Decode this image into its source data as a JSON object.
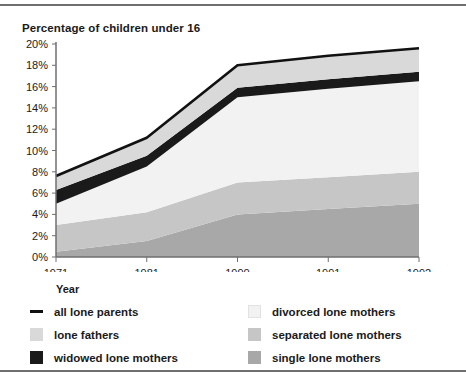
{
  "chart_title": "Percentage of children under 16",
  "axis_name_label": "Year",
  "legend": [
    {
      "key": "all_lone_parents",
      "label": "all lone parents",
      "marker": "line",
      "color": "#111111"
    },
    {
      "key": "divorced_lone_mothers",
      "label": "divorced lone mothers",
      "marker": "box",
      "color": "#f2f2f2"
    },
    {
      "key": "lone_fathers",
      "label": "lone fathers",
      "marker": "box",
      "color": "#d9d9d9"
    },
    {
      "key": "separated_lone_mothers",
      "label": "separated lone mothers",
      "marker": "box",
      "color": "#c6c6c6"
    },
    {
      "key": "widowed_lone_mothers",
      "label": "widowed lone mothers",
      "marker": "box",
      "color": "#1a1a1a"
    },
    {
      "key": "single_lone_mothers",
      "label": "single lone mothers",
      "marker": "box",
      "color": "#a8a8a8"
    }
  ],
  "chart_data": {
    "type": "area",
    "title": "Percentage of children under 16",
    "xlabel": "Year",
    "ylabel": "Percentage of children under 16",
    "categories": [
      "1971",
      "1981",
      "1990",
      "1991",
      "1992"
    ],
    "x_tick_labels": [
      "1971",
      "1981",
      "1990",
      "1991",
      "1992"
    ],
    "y_tick_labels": [
      "0%",
      "2%",
      "4%",
      "6%",
      "8%",
      "10%",
      "12%",
      "14%",
      "16%",
      "18%",
      "20%"
    ],
    "ylim": [
      0,
      20
    ],
    "y_tick_step": 2,
    "grid": false,
    "legend_position": "below-plot",
    "stacked": true,
    "stack_order_bottom_to_top": [
      "single lone mothers",
      "separated lone mothers",
      "divorced lone mothers",
      "widowed lone mothers",
      "lone fathers"
    ],
    "series": [
      {
        "name": "single lone mothers",
        "color": "#a8a8a8",
        "values": [
          0.5,
          1.5,
          4.0,
          4.5,
          5.0
        ]
      },
      {
        "name": "separated lone mothers",
        "color": "#c6c6c6",
        "values": [
          2.5,
          2.7,
          3.0,
          3.0,
          3.0
        ]
      },
      {
        "name": "divorced lone mothers",
        "color": "#f2f2f2",
        "values": [
          2.0,
          4.3,
          8.0,
          8.3,
          8.5
        ]
      },
      {
        "name": "widowed lone mothers",
        "color": "#1a1a1a",
        "values": [
          1.3,
          1.0,
          0.9,
          0.9,
          0.9
        ]
      },
      {
        "name": "lone fathers",
        "color": "#d9d9d9",
        "values": [
          1.3,
          1.7,
          2.1,
          2.2,
          2.2
        ]
      }
    ],
    "total_line": {
      "name": "all lone parents",
      "color": "#111111",
      "values": [
        7.6,
        11.2,
        18.0,
        18.9,
        19.6
      ]
    }
  }
}
